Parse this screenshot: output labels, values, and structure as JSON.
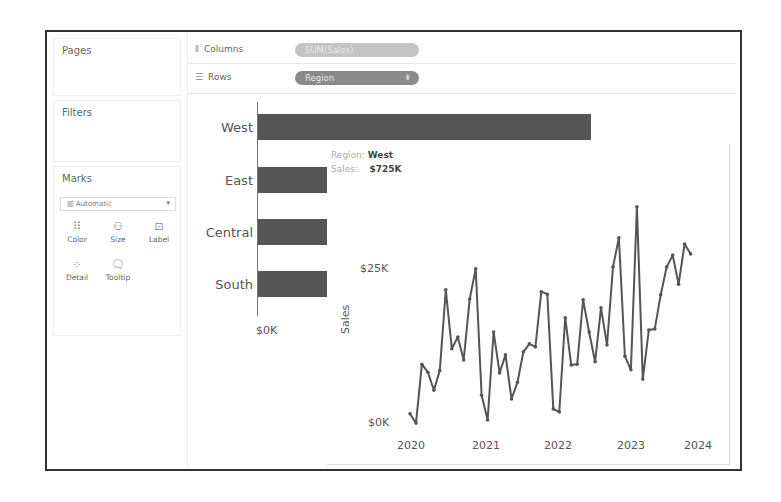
{
  "sidebar": {
    "pages_title": "Pages",
    "filters_title": "Filters",
    "marks": {
      "title": "Marks",
      "mark_type": "Automatic",
      "mark_type_icon": "bar-chart-icon",
      "buttons": [
        {
          "label": "Color",
          "icon": "color-dots-icon"
        },
        {
          "label": "Size",
          "icon": "size-circles-icon"
        },
        {
          "label": "Label",
          "icon": "label-box-icon"
        },
        {
          "label": "Detail",
          "icon": "detail-dots-icon"
        },
        {
          "label": "Tooltip",
          "icon": "tooltip-bubble-icon"
        }
      ]
    }
  },
  "shelves": {
    "columns": {
      "label": "Columns",
      "icon": "columns-icon",
      "pill": "SUM(Sales)"
    },
    "rows": {
      "label": "Rows",
      "icon": "rows-icon",
      "pill": "Region",
      "pill_icon": "sort-descending-icon"
    }
  },
  "bar_chart": {
    "regions": [
      "West",
      "East",
      "Central",
      "South"
    ],
    "axis_tick": "$0K"
  },
  "tooltip": {
    "region_label": "Region:",
    "region_value": "West",
    "sales_label": "Sales:",
    "sales_value": "$725K",
    "y_ticks": [
      "$25K",
      "$0K"
    ],
    "y_label": "Sales",
    "x_ticks": [
      "2020",
      "2021",
      "2022",
      "2023",
      "2024"
    ]
  },
  "colors": {
    "bar": "#555555",
    "line": "#555555",
    "frame": "#333333",
    "pill_columns": "#c4c4c4",
    "pill_rows": "#8a8a8a"
  },
  "chart_data": [
    {
      "type": "bar",
      "title": "",
      "orientation": "horizontal",
      "categories": [
        "West",
        "East",
        "Central",
        "South"
      ],
      "values": [
        725,
        265,
        265,
        265
      ],
      "xlabel": "SUM(Sales)",
      "ylabel": "Region",
      "x_ticks": [
        "$0K"
      ],
      "note": "Only West bar fully visible ($725K from tooltip); other bars are occluded by the tooltip panel"
    },
    {
      "type": "line",
      "title": "Tooltip viz: monthly Sales for Region West",
      "xlabel": "",
      "ylabel": "Sales",
      "x_ticks": [
        "2020",
        "2021",
        "2022",
        "2023",
        "2024"
      ],
      "y_ticks": [
        "$0K",
        "$25K"
      ],
      "ylim": [
        0,
        35
      ],
      "x": [
        "2020-01",
        "2020-02",
        "2020-03",
        "2020-04",
        "2020-05",
        "2020-06",
        "2020-07",
        "2020-08",
        "2020-09",
        "2020-10",
        "2020-11",
        "2020-12",
        "2021-01",
        "2021-02",
        "2021-03",
        "2021-04",
        "2021-05",
        "2021-06",
        "2021-07",
        "2021-08",
        "2021-09",
        "2021-10",
        "2021-11",
        "2021-12",
        "2022-01",
        "2022-02",
        "2022-03",
        "2022-04",
        "2022-05",
        "2022-06",
        "2022-07",
        "2022-08",
        "2022-09",
        "2022-10",
        "2022-11",
        "2022-12",
        "2023-01",
        "2023-02",
        "2023-03",
        "2023-04",
        "2023-05",
        "2023-06",
        "2023-07",
        "2023-08",
        "2023-09",
        "2023-10",
        "2023-11",
        "2023-12"
      ],
      "series": [
        {
          "name": "Sales ($K)",
          "values": [
            1.8,
            0.3,
            9.8,
            8.5,
            5.6,
            8.8,
            21.8,
            12.3,
            14.2,
            10.5,
            20.3,
            25.2,
            4.8,
            0.8,
            15.0,
            8.4,
            11.3,
            4.2,
            6.9,
            11.8,
            13.1,
            12.6,
            21.5,
            21.1,
            2.6,
            2.1,
            17.3,
            9.7,
            9.8,
            20.2,
            15.0,
            10.2,
            18.9,
            12.9,
            25.5,
            30.2,
            11.1,
            8.9,
            35.2,
            7.4,
            15.3,
            15.5,
            21.0,
            25.5,
            27.4,
            22.7,
            29.2,
            27.6
          ]
        }
      ]
    }
  ]
}
